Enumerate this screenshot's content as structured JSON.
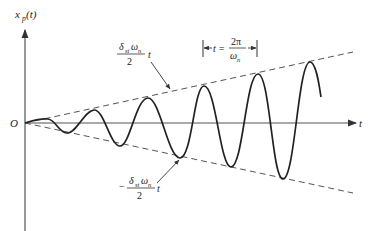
{
  "diagram": {
    "type": "resonance-response-plot",
    "y_axis": {
      "label": "x",
      "label_sub": "p",
      "label_arg": "(t)"
    },
    "x_axis": {
      "label": "t"
    },
    "origin_label": "O",
    "upper_envelope": {
      "numerator": "δ",
      "num_sub": "st",
      "num_rest": "ω",
      "num_rest_sub": "n",
      "denominator": "2",
      "suffix": "t",
      "sign": ""
    },
    "lower_envelope": {
      "numerator": "δ",
      "num_sub": "st",
      "num_rest": "ω",
      "num_rest_sub": "n",
      "denominator": "2",
      "suffix": "t",
      "sign": "−"
    },
    "period_annotation": {
      "lhs": "t =",
      "numerator": "2π",
      "denominator": "ω",
      "den_sub": "n"
    },
    "colors": {
      "curve": "#222222",
      "axis": "#555555",
      "dashed": "#555555",
      "background": "#ffffff"
    }
  }
}
